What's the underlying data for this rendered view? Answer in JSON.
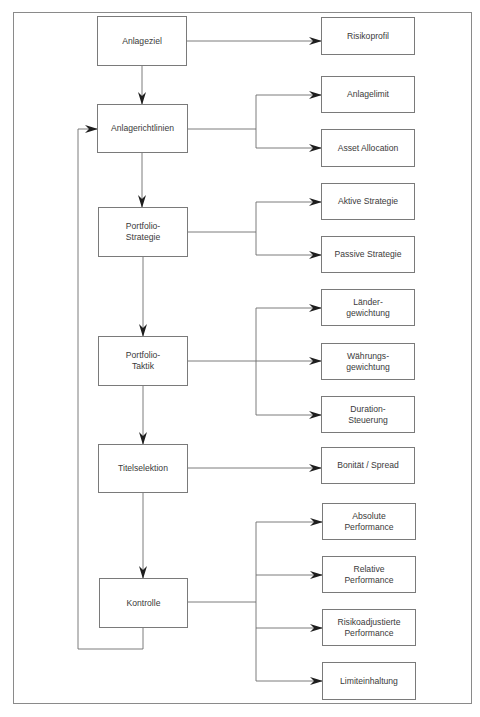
{
  "diagram": {
    "main_steps": [
      {
        "label": "Anlageziel"
      },
      {
        "label": "Anlagerichtlinien"
      },
      {
        "label": "Portfolio-\nStrategie"
      },
      {
        "label": "Portfolio-\nTaktik"
      },
      {
        "label": "Titelselektion"
      },
      {
        "label": "Kontrolle"
      }
    ],
    "details": {
      "anlageziel": [
        {
          "label": "Risikoprofil"
        }
      ],
      "anlagerichtlinien": [
        {
          "label": "Anlagelimit"
        },
        {
          "label": "Asset Allocation"
        }
      ],
      "portfolio_strategie": [
        {
          "label": "Aktive Strategie"
        },
        {
          "label": "Passive Strategie"
        }
      ],
      "portfolio_taktik": [
        {
          "label": "Länder-\ngewichtung"
        },
        {
          "label": "Währungs-\ngewichtung"
        },
        {
          "label": "Duration-\nSteuerung"
        }
      ],
      "titelselektion": [
        {
          "label": "Bonität / Spread"
        }
      ],
      "kontrolle": [
        {
          "label": "Absolute\nPerformance"
        },
        {
          "label": "Relative\nPerformance"
        },
        {
          "label": "Risikoadjustierte\nPerformance"
        },
        {
          "label": "Limiteinhaltung"
        }
      ]
    },
    "feedback_loop": {
      "from": "Kontrolle",
      "to": "Anlagerichtlinien"
    },
    "colors": {
      "line": "#6e6e6e",
      "arrow": "#1e1e1e",
      "border": "#7a7a7a",
      "text": "#3a3a3a"
    }
  }
}
